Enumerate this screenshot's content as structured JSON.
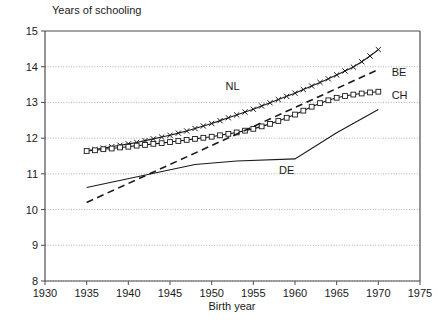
{
  "chart_data": {
    "type": "line",
    "title": "Years of schooling",
    "xlabel": "Birth year",
    "ylabel": "Years of schooling",
    "xlim": [
      1930,
      1975
    ],
    "ylim": [
      8,
      15
    ],
    "xticks": [
      1930,
      1935,
      1940,
      1945,
      1950,
      1955,
      1960,
      1965,
      1970,
      1975
    ],
    "yticks": [
      8,
      9,
      10,
      11,
      12,
      13,
      14,
      15
    ],
    "grid": "horizontal-dotted",
    "legend": "inline-labels",
    "series": [
      {
        "name": "NL",
        "label": "NL",
        "marker": "x",
        "style": "solid",
        "label_x": 1952.5,
        "label_y": 13.45,
        "x": [
          1935,
          1936,
          1937,
          1938,
          1939,
          1940,
          1941,
          1942,
          1943,
          1944,
          1945,
          1946,
          1947,
          1948,
          1949,
          1950,
          1951,
          1952,
          1953,
          1954,
          1955,
          1956,
          1957,
          1958,
          1959,
          1960,
          1961,
          1962,
          1963,
          1964,
          1965,
          1966,
          1967,
          1968,
          1969,
          1970
        ],
        "values": [
          11.65,
          11.68,
          11.72,
          11.76,
          11.8,
          11.84,
          11.88,
          11.93,
          11.98,
          12.03,
          12.08,
          12.14,
          12.2,
          12.27,
          12.34,
          12.41,
          12.49,
          12.57,
          12.65,
          12.73,
          12.81,
          12.9,
          12.99,
          13.08,
          13.17,
          13.26,
          13.36,
          13.46,
          13.56,
          13.66,
          13.77,
          13.88,
          13.99,
          14.14,
          14.3,
          14.48
        ]
      },
      {
        "name": "CH",
        "label": "CH",
        "marker": "square",
        "style": "solid",
        "label_x": 1971.6,
        "label_y": 13.22,
        "x": [
          1935,
          1936,
          1937,
          1938,
          1939,
          1940,
          1941,
          1942,
          1943,
          1944,
          1945,
          1946,
          1947,
          1948,
          1949,
          1950,
          1951,
          1952,
          1953,
          1954,
          1955,
          1956,
          1957,
          1958,
          1959,
          1960,
          1961,
          1962,
          1963,
          1964,
          1965,
          1966,
          1967,
          1968,
          1969,
          1970
        ],
        "values": [
          11.64,
          11.66,
          11.69,
          11.71,
          11.74,
          11.76,
          11.79,
          11.81,
          11.84,
          11.86,
          11.89,
          11.92,
          11.95,
          11.98,
          12.01,
          12.04,
          12.08,
          12.12,
          12.16,
          12.21,
          12.26,
          12.33,
          12.4,
          12.48,
          12.57,
          12.66,
          12.77,
          12.88,
          12.98,
          13.06,
          13.13,
          13.18,
          13.22,
          13.25,
          13.28,
          13.3
        ]
      },
      {
        "name": "BE",
        "label": "BE",
        "marker": "none",
        "style": "dashed",
        "label_x": 1971.6,
        "label_y": 13.85,
        "x": [
          1935,
          1970
        ],
        "values": [
          10.2,
          13.92
        ]
      },
      {
        "name": "DE",
        "label": "DE",
        "marker": "none",
        "style": "solid-thin",
        "label_x": 1959.0,
        "label_y": 11.12,
        "x": [
          1935,
          1948,
          1953,
          1960,
          1965,
          1970
        ],
        "values": [
          10.62,
          11.26,
          11.36,
          11.42,
          12.15,
          12.8
        ]
      }
    ]
  },
  "colors": {
    "ink": "#1a1a1a",
    "axis": "#4d4d4d",
    "grid": "#9a9a9a",
    "background": "#ffffff"
  }
}
